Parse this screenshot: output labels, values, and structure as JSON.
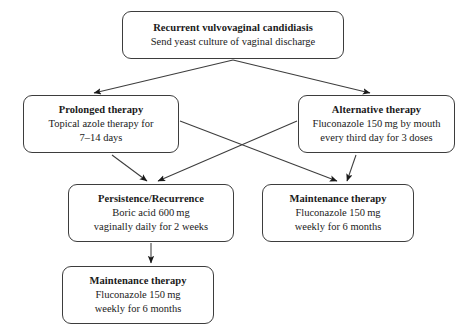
{
  "diagram": {
    "background_color": "#ffffff",
    "line_color": "#3d3d3d",
    "text_color": "#1a1a1a",
    "nodes": {
      "root": {
        "title": "Recurrent vulvovaginal candidiasis",
        "line1": "Send yeast culture of vaginal discharge"
      },
      "prolonged": {
        "title": "Prolonged therapy",
        "line1": "Topical azole therapy for",
        "line2": "7–14 days"
      },
      "alternative": {
        "title": "Alternative therapy",
        "line1": "Fluconazole 150 mg by mouth",
        "line2": "every third day for 3 doses"
      },
      "persistence": {
        "title": "Persistence/Recurrence",
        "line1": "Boric acid 600 mg",
        "line2": "vaginally daily for 2 weeks"
      },
      "maintenance_right": {
        "title": "Maintenance therapy",
        "line1": "Fluconazole 150 mg",
        "line2": "weekly for 6 months"
      },
      "maintenance_bottom": {
        "title": "Maintenance therapy",
        "line1": "Fluconazole 150 mg",
        "line2": "weekly for 6 months"
      }
    },
    "edges": [
      {
        "name": "root-to-prolonged",
        "from": "root",
        "to": "prolonged",
        "style": "diagonal-arrow"
      },
      {
        "name": "root-to-alternative",
        "from": "root",
        "to": "alternative",
        "style": "diagonal-arrow"
      },
      {
        "name": "prolonged-to-persistence",
        "from": "prolonged",
        "to": "persistence",
        "style": "diagonal-arrow"
      },
      {
        "name": "prolonged-to-maintenance",
        "from": "prolonged",
        "to": "maintenance_right",
        "style": "diagonal-arrow-crossing"
      },
      {
        "name": "alternative-to-persistence",
        "from": "alternative",
        "to": "persistence",
        "style": "diagonal-arrow-crossing"
      },
      {
        "name": "alternative-to-maintenance",
        "from": "alternative",
        "to": "maintenance_right",
        "style": "diagonal-arrow"
      },
      {
        "name": "persistence-to-maintenance",
        "from": "persistence",
        "to": "maintenance_bottom",
        "style": "vertical-arrow"
      }
    ]
  }
}
